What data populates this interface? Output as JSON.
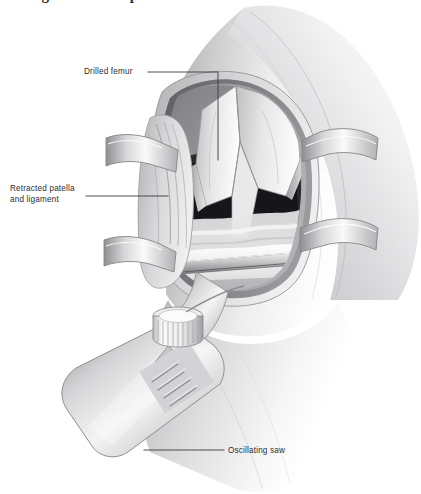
{
  "figure": {
    "caption_sliver": "cutting of the tibial plateau.",
    "alt_title": "Drilled femur exposed with retractors and oscillating saw cutting the tibial plateau",
    "width": 421,
    "height": 494,
    "background_color": "#ffffff",
    "ink_color": "#2e2e33",
    "line_color": "#3a3a40"
  },
  "labels": {
    "drilled_femur": "Drilled femur",
    "retracted_patella": "Retracted patella\nand ligament",
    "oscillating_saw": "Oscillating saw"
  },
  "palette": {
    "skin_light": "#f2f2f2",
    "skin_mid": "#d9d9da",
    "skin_shadow": "#b9b9bb",
    "skin_deep": "#9a9a9d",
    "fat_layer": "#cfcfd1",
    "muscle_dark": "#6e6e72",
    "joint_void": "#1c1c1f",
    "bone_light": "#fbfbfb",
    "bone_mid": "#e3e3e4",
    "bone_shadow": "#c2c2c4",
    "metal_light": "#fafafa",
    "metal_mid": "#d2d2d4",
    "metal_dark": "#8d8d91",
    "blade_edge": "#5a5a5e"
  },
  "anatomy_parts": [
    {
      "name": "thigh",
      "label": "Thigh / distal femur soft tissue"
    },
    {
      "name": "drilled-femur",
      "label": "Drilled femur"
    },
    {
      "name": "intercondylar-notch",
      "label": "Intercondylar notch"
    },
    {
      "name": "joint-space",
      "label": "Joint space"
    },
    {
      "name": "tibial-plateau",
      "label": "Tibial plateau"
    },
    {
      "name": "retracted-patella",
      "label": "Retracted patella and ligament"
    },
    {
      "name": "lower-leg",
      "label": "Lower leg / tibia soft tissue"
    }
  ],
  "instruments": [
    {
      "name": "retractor-left-upper",
      "label": "Retractor blade, left upper"
    },
    {
      "name": "retractor-left-lower",
      "label": "Retractor blade, left lower"
    },
    {
      "name": "retractor-right-upper",
      "label": "Retractor blade, right upper"
    },
    {
      "name": "retractor-right-lower",
      "label": "Retractor blade, right lower"
    },
    {
      "name": "oscillating-saw-blade",
      "label": "Saw blade"
    },
    {
      "name": "oscillating-saw-collar",
      "label": "Knurled chuck collar"
    },
    {
      "name": "oscillating-saw-handpiece",
      "label": "Saw handpiece with ribbed grip"
    }
  ]
}
